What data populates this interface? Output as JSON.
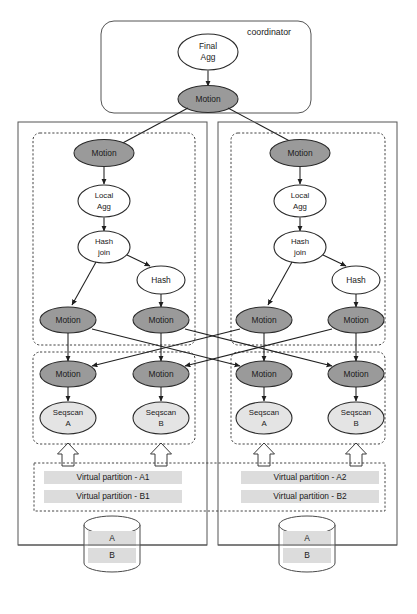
{
  "diagram": {
    "coordinator": {
      "label": "coordinator",
      "nodes": {
        "final_agg": "Final\nAgg",
        "final_agg_line1": "Final",
        "final_agg_line2": "Agg",
        "motion": "Motion"
      }
    },
    "node_labels": {
      "motion": "Motion",
      "local_agg_line1": "Local",
      "local_agg_line2": "Agg",
      "hash_join_line1": "Hash",
      "hash_join_line2": "join",
      "hash": "Hash",
      "seqscan_line1": "Seqscan",
      "seqscan_a": "A",
      "seqscan_b": "B"
    },
    "segments": [
      {
        "label": "Segment 1",
        "plan": {
          "top_motion": "Motion",
          "local_agg": [
            "Local",
            "Agg"
          ],
          "hash_join": [
            "Hash",
            "join"
          ],
          "hash": "Hash",
          "sender_motion_left": "Motion",
          "sender_motion_right": "Motion",
          "receiver_motion_left": "Motion",
          "receiver_motion_right": "Motion",
          "seqscan_left": [
            "Seqscan",
            "A"
          ],
          "seqscan_right": [
            "Seqscan",
            "B"
          ]
        },
        "partitions": [
          "Virtual partition - A1",
          "Virtual partition - B1"
        ],
        "storage": {
          "tables": [
            "A",
            "B"
          ]
        }
      },
      {
        "label": "Segment 2",
        "plan": {
          "top_motion": "Motion",
          "local_agg": [
            "Local",
            "Agg"
          ],
          "hash_join": [
            "Hash",
            "join"
          ],
          "hash": "Hash",
          "sender_motion_left": "Motion",
          "sender_motion_right": "Motion",
          "receiver_motion_left": "Motion",
          "receiver_motion_right": "Motion",
          "seqscan_left": [
            "Seqscan",
            "A"
          ],
          "seqscan_right": [
            "Seqscan",
            "B"
          ]
        },
        "partitions": [
          "Virtual partition - A2",
          "Virtual partition - B2"
        ],
        "storage": {
          "tables": [
            "A",
            "B"
          ]
        }
      }
    ],
    "colors": {
      "motion_fill": "#9a9a9a",
      "plain_fill": "#ffffff",
      "scan_fill": "#e4e4e4",
      "band_fill": "#dcdcdc",
      "stroke": "#2b2b2b",
      "background": "#ffffff"
    }
  }
}
